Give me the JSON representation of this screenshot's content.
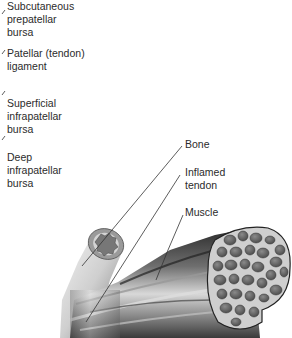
{
  "left_labels": [
    {
      "lines": [
        "Subcutaneous",
        "prepatellar",
        "bursa"
      ]
    },
    {
      "lines": [
        "Patellar (tendon)",
        "ligament"
      ]
    },
    {
      "lines": [
        "Superficial",
        "infrapatellar",
        "bursa"
      ]
    },
    {
      "lines": [
        "Deep",
        "infrapatellar",
        "bursa"
      ]
    }
  ],
  "right_labels": [
    {
      "lines": [
        "Bone"
      ]
    },
    {
      "lines": [
        "Inflamed",
        "tendon"
      ]
    },
    {
      "lines": [
        "Muscle"
      ]
    }
  ],
  "colors": {
    "text": "#2b2b2b",
    "leader": "#333333",
    "bone_light": "#e6e6e6",
    "bone_dark": "#6a6a6a",
    "muscle_dark": "#2f2f2f",
    "fiber_fill": "#6b6b6b",
    "fascicle_bg": "#c9c9c9"
  }
}
